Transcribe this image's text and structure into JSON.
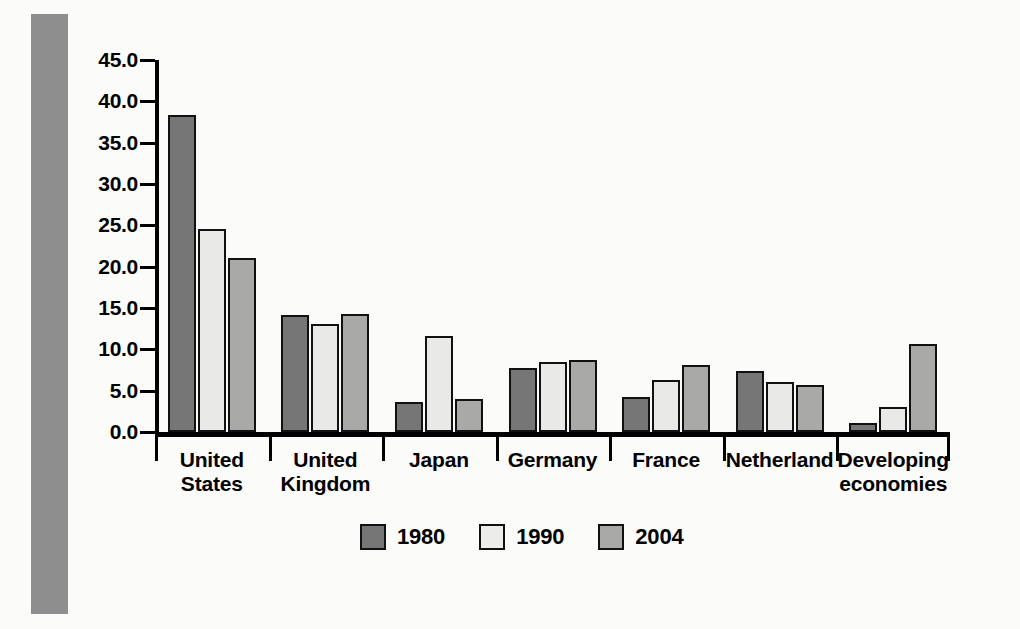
{
  "chart_data": {
    "type": "bar",
    "title": "",
    "subtitle": "",
    "xlabel": "",
    "ylabel": "",
    "ylim": [
      0.0,
      45.0
    ],
    "ytick_step": 5.0,
    "ytick_labels": [
      "45.0",
      "40.0",
      "35.0",
      "30.0",
      "25.0",
      "20.0",
      "15.0",
      "10.0",
      "5.0",
      "0.0"
    ],
    "grid": false,
    "legend_position": "bottom-center",
    "categories": [
      "United States",
      "United Kingdom",
      "Japan",
      "Germany",
      "France",
      "Netherland",
      "Developing economies"
    ],
    "category_lines": [
      [
        "United",
        "States"
      ],
      [
        "United",
        "Kingdom"
      ],
      [
        "Japan"
      ],
      [
        "Germany"
      ],
      [
        "France"
      ],
      [
        "Netherland"
      ],
      [
        "Developing",
        "economies"
      ]
    ],
    "series": [
      {
        "name": "1980",
        "color": "#767676",
        "values": [
          38.3,
          14.2,
          3.6,
          7.7,
          4.2,
          7.4,
          1.1
        ]
      },
      {
        "name": "1990",
        "color": "#e9e9e7",
        "values": [
          24.6,
          13.1,
          11.6,
          8.5,
          6.3,
          6.1,
          3.0
        ]
      },
      {
        "name": "2004",
        "color": "#a9a9a7",
        "values": [
          21.0,
          14.3,
          4.0,
          8.7,
          8.1,
          5.7,
          10.7
        ]
      }
    ]
  },
  "legend": {
    "items": [
      {
        "label": "1980",
        "series_class": "s1980"
      },
      {
        "label": "1990",
        "series_class": "s1990"
      },
      {
        "label": "2004",
        "series_class": "s2004"
      }
    ]
  }
}
